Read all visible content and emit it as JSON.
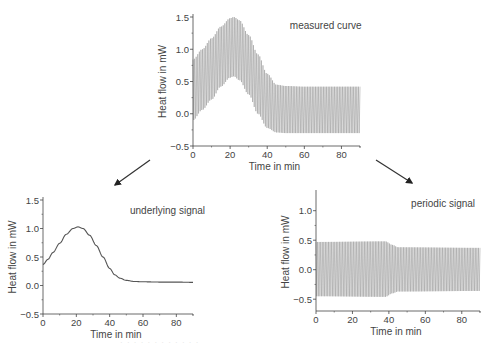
{
  "figure": {
    "caption_faint": "· · · · · · · · · · · ·",
    "arrows": [
      {
        "name": "arrow-to-underlying",
        "from": [
          150,
          160
        ],
        "to": [
          115,
          185
        ]
      },
      {
        "name": "arrow-to-periodic",
        "from": [
          376,
          160
        ],
        "to": [
          412,
          183
        ]
      }
    ]
  },
  "chart_data": [
    {
      "id": "measured",
      "type": "line",
      "title": "measured curve",
      "xlabel": "Time in min",
      "ylabel": "Heat flow in mW",
      "xlim": [
        0,
        90
      ],
      "ylim": [
        -0.5,
        1.5
      ],
      "xticks": [
        0,
        20,
        40,
        60,
        80
      ],
      "yticks": [
        -0.5,
        0.0,
        0.5,
        1.0,
        1.5
      ],
      "ytick_labels": [
        "-0.5",
        "0.0",
        "0.5",
        "1.0",
        "1.5"
      ],
      "grid": false,
      "style": "oscillating",
      "envelope_upper": {
        "x": [
          0,
          5,
          10,
          15,
          20,
          22,
          25,
          30,
          35,
          40,
          45,
          50,
          60,
          70,
          80,
          90
        ],
        "y": [
          0.84,
          1.0,
          1.17,
          1.35,
          1.48,
          1.5,
          1.45,
          1.22,
          0.92,
          0.62,
          0.45,
          0.43,
          0.42,
          0.42,
          0.42,
          0.42
        ]
      },
      "envelope_lower": {
        "x": [
          0,
          5,
          10,
          15,
          20,
          22,
          25,
          30,
          35,
          40,
          45,
          50,
          60,
          70,
          80,
          90
        ],
        "y": [
          -0.1,
          0.06,
          0.22,
          0.42,
          0.56,
          0.58,
          0.52,
          0.3,
          0.0,
          -0.22,
          -0.29,
          -0.3,
          -0.3,
          -0.3,
          -0.3,
          -0.3
        ]
      },
      "periods": 105,
      "frame": {
        "x0": 193,
        "y_top": 17,
        "x1": 360,
        "y_bottom": 146
      }
    },
    {
      "id": "underlying",
      "type": "line",
      "title": "underlying signal",
      "xlabel": "Time in min",
      "ylabel": "Heat flow in mW",
      "xlim": [
        0,
        90
      ],
      "ylim": [
        -0.5,
        1.5
      ],
      "xticks": [
        0,
        20,
        40,
        60,
        80
      ],
      "yticks": [
        -0.5,
        0.0,
        0.5,
        1.0,
        1.5
      ],
      "ytick_labels": [
        "-0.5",
        "0.0",
        "0.5",
        "1.0",
        "1.5"
      ],
      "grid": false,
      "style": "line",
      "x": [
        0,
        3,
        6,
        10,
        14,
        18,
        21,
        24,
        28,
        32,
        36,
        40,
        43,
        46,
        50,
        55,
        60,
        70,
        80,
        90
      ],
      "y": [
        0.37,
        0.46,
        0.58,
        0.74,
        0.9,
        1.0,
        1.03,
        1.0,
        0.88,
        0.7,
        0.5,
        0.3,
        0.19,
        0.13,
        0.09,
        0.07,
        0.065,
        0.06,
        0.06,
        0.055
      ],
      "frame": {
        "x0": 43,
        "y_top": 200,
        "x1": 193,
        "y_bottom": 314
      }
    },
    {
      "id": "periodic",
      "type": "line",
      "title": "periodic signal",
      "xlabel": "Time in min",
      "ylabel": "Heat flow in mW",
      "xlim": [
        0,
        90
      ],
      "ylim": [
        -0.7,
        1.3
      ],
      "xticks": [
        0,
        20,
        40,
        60,
        80
      ],
      "yticks": [
        -0.5,
        0.0,
        0.5,
        1.0
      ],
      "ytick_labels": [
        "-0.5",
        "0.0",
        "0.5",
        "1.0"
      ],
      "grid": false,
      "style": "oscillating",
      "envelope_upper": {
        "x": [
          0,
          38,
          42,
          45,
          90
        ],
        "y": [
          0.47,
          0.48,
          0.42,
          0.38,
          0.37
        ]
      },
      "envelope_lower": {
        "x": [
          0,
          38,
          42,
          45,
          90
        ],
        "y": [
          -0.45,
          -0.46,
          -0.4,
          -0.37,
          -0.36
        ]
      },
      "periods": 105,
      "frame": {
        "x0": 316,
        "y_top": 193,
        "x1": 480,
        "y_bottom": 311
      }
    }
  ]
}
